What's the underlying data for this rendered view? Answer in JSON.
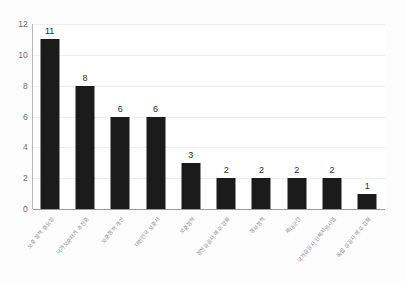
{
  "chart_data": {
    "type": "bar",
    "title": "",
    "subtitle": "",
    "xlabel": "",
    "ylabel": "",
    "ylim": [
      0,
      12
    ],
    "ytick_step": 2,
    "yticks": [
      0,
      2,
      4,
      6,
      8,
      10,
      12
    ],
    "grid": true,
    "legend": false,
    "legend_position": "none",
    "bar_color": "#1b1b1b",
    "gridline_color": "#efefef",
    "axis_color": "#9a9a9a",
    "value_label_color": "#2b2b2b",
    "tick_label_color": "#6e6e6e",
    "categories": [
      "보훈 정책 중요성",
      "국가보훈처가 추진중",
      "보훈정책 개선",
      "대한민국 보훈처",
      "보훈정책",
      "참전유공자 예우 강화",
      "정부정책",
      "제대군인",
      "국가유공자 단체지원사업",
      "독립 유공자 예우 강화"
    ],
    "values": [
      11,
      8,
      6,
      6,
      3,
      2,
      2,
      2,
      2,
      1
    ],
    "value_labels": [
      "11",
      "8",
      "6",
      "6",
      "3",
      "2",
      "2",
      "2",
      "2",
      "1"
    ]
  }
}
